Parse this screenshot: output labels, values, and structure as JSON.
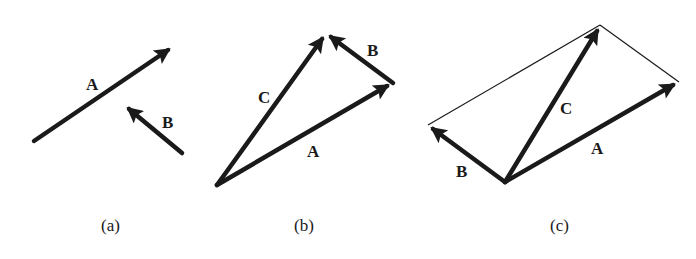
{
  "figure": {
    "panels": [
      {
        "caption": "(a)",
        "vectors": [
          {
            "label": "A",
            "from": [
              34,
              141
            ],
            "to": [
              174,
              46
            ],
            "label_pos": [
              92,
              90
            ]
          },
          {
            "label": "B",
            "from": [
              182,
              153
            ],
            "to": [
              124,
              105
            ],
            "label_pos": [
              169,
              128
            ]
          }
        ],
        "caption_pos": [
          112,
          231
        ]
      },
      {
        "caption": "(b)",
        "vectors": [
          {
            "label": "A",
            "from": [
              217,
              185
            ],
            "to": [
              393,
              83
            ],
            "label_pos": [
              313,
              157
            ]
          },
          {
            "label": "B",
            "from": [
              393,
              83
            ],
            "to": [
              326,
              33
            ],
            "label_pos": [
              373,
              56
            ]
          },
          {
            "label": "C",
            "from": [
              217,
              185
            ],
            "to": [
              326,
              33
            ],
            "label_pos": [
              264,
              103
            ]
          }
        ],
        "caption_pos": [
          305,
          231
        ]
      },
      {
        "caption": "(c)",
        "vectors": [
          {
            "label": "A",
            "from": [
              505,
              182
            ],
            "to": [
              679,
              82
            ],
            "label_pos": [
              597,
              154
            ]
          },
          {
            "label": "B",
            "from": [
              505,
              182
            ],
            "to": [
              428,
              125
            ],
            "label_pos": [
              462,
              177
            ]
          },
          {
            "label": "C",
            "from": [
              505,
              182
            ],
            "to": [
              600,
              25
            ],
            "label_pos": [
              566,
              114
            ]
          }
        ],
        "parallelogram_sides": [
          {
            "from": [
              428,
              125
            ],
            "to": [
              600,
              25
            ]
          },
          {
            "from": [
              600,
              25
            ],
            "to": [
              679,
              82
            ]
          }
        ],
        "caption_pos": [
          561,
          231
        ]
      }
    ],
    "colors": {
      "ink": "#1a1a1a",
      "background": "#ffffff"
    }
  },
  "labels": {
    "a": {
      "A": "A",
      "B": "B",
      "caption": "(a)"
    },
    "b": {
      "A": "A",
      "B": "B",
      "C": "C",
      "caption": "(b)"
    },
    "c": {
      "A": "A",
      "B": "B",
      "C": "C",
      "caption": "(c)"
    }
  }
}
